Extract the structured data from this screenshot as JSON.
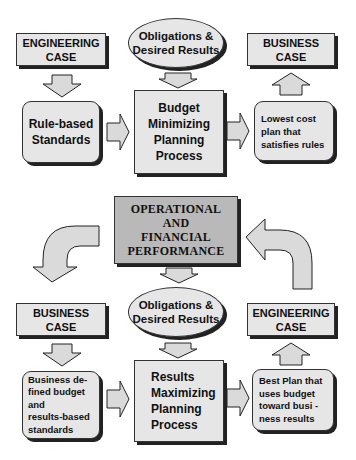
{
  "top_section": {
    "engineering_case": "ENGINEERING\nCASE",
    "obligations": "Obligations &\nDesired Results",
    "business_case": "BUSINESS\nCASE",
    "standards": "Rule-based\nStandards",
    "process": "Budget\nMinimizing\nPlanning\nProcess",
    "output": "Lowest cost\nplan that\nsatisfies rules"
  },
  "center": {
    "performance": "OPERATIONAL\nAND\nFINANCIAL\nPERFORMANCE"
  },
  "bottom_section": {
    "business_case": "BUSINESS\nCASE",
    "obligations": "Obligations &\nDesired Results",
    "engineering_case": "ENGINEERING\nCASE",
    "standards": "Business de-\nfined budget\n      and\nresults-based\nstandards",
    "process": "Results\nMaximizing\nPlanning\nProcess",
    "output": "Best Plan that\nuses budget\ntoward   busi -\nness results"
  },
  "colors": {
    "box_fill": "#e6e6e6",
    "performance_fill": "#b9b9b9",
    "outline": "#222222"
  }
}
